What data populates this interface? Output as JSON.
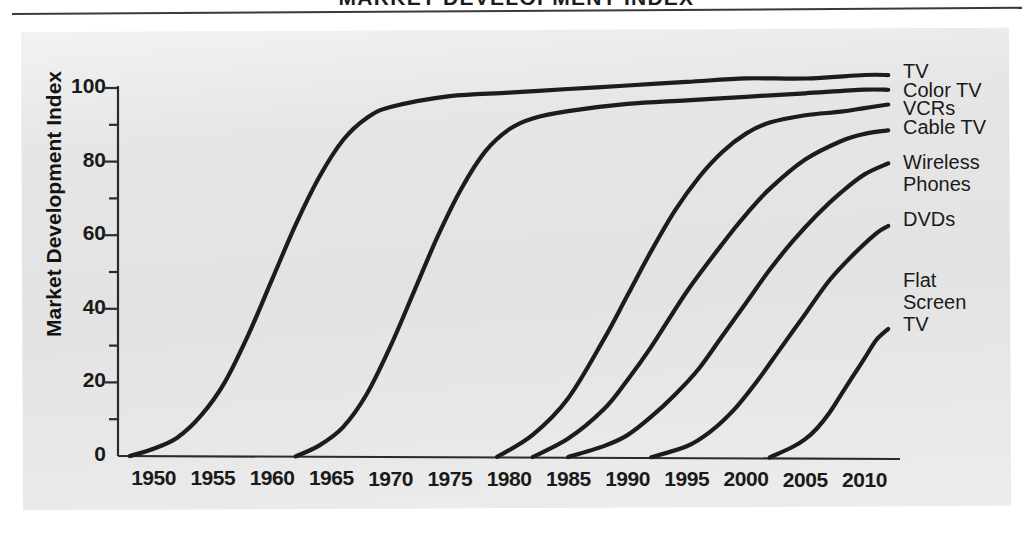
{
  "header": {
    "title": "MARKET DEVELOPMENT INDEX",
    "rule": "horizontal-rule"
  },
  "colors": {
    "panel_background": "#e3e3e3",
    "curve": "#1c1c1c",
    "axis": "#2b2b2b",
    "text": "#1a1a1a"
  },
  "chart_data": {
    "type": "line",
    "title": "MARKET DEVELOPMENT INDEX",
    "xlabel": "",
    "ylabel": "Market Development Index",
    "xlim": [
      1947,
      2013
    ],
    "ylim": [
      0,
      107
    ],
    "grid": false,
    "legend_position": "right-inline-labels",
    "x_ticks": [
      "1950",
      "1955",
      "1960",
      "1965",
      "1970",
      "1975",
      "1980",
      "1985",
      "1990",
      "1995",
      "2000",
      "2005",
      "2010"
    ],
    "x_tick_values": [
      1950,
      1955,
      1960,
      1965,
      1970,
      1975,
      1980,
      1985,
      1990,
      1995,
      2000,
      2005,
      2010
    ],
    "y_ticks": [
      "0",
      "20",
      "40",
      "60",
      "80",
      "100"
    ],
    "y_tick_values": [
      0,
      20,
      40,
      60,
      80,
      100
    ],
    "y_minor_ticks": [
      10,
      30,
      50,
      70,
      90
    ],
    "series": [
      {
        "name": "TV",
        "label": "TV",
        "start_year": 1948,
        "x": [
          1948,
          1950,
          1952,
          1954,
          1956,
          1958,
          1960,
          1962,
          1964,
          1966,
          1968,
          1970,
          1975,
          1980,
          1985,
          1990,
          1995,
          2000,
          2005,
          2010,
          2012
        ],
        "values": [
          0,
          2,
          5,
          11,
          20,
          33,
          48,
          63,
          76,
          86,
          92,
          95,
          98,
          99,
          100,
          101,
          102,
          103,
          103,
          104,
          104
        ]
      },
      {
        "name": "Color TV",
        "label": "Color TV",
        "start_year": 1962,
        "x": [
          1962,
          1964,
          1966,
          1968,
          1970,
          1972,
          1974,
          1976,
          1978,
          1980,
          1982,
          1985,
          1990,
          1995,
          2000,
          2005,
          2010,
          2012
        ],
        "values": [
          0,
          3,
          8,
          17,
          30,
          45,
          60,
          73,
          83,
          89,
          92,
          94,
          96,
          97,
          98,
          99,
          100,
          100
        ]
      },
      {
        "name": "VCRs",
        "label": "VCRs",
        "start_year": 1979,
        "x": [
          1979,
          1982,
          1985,
          1988,
          1990,
          1992,
          1994,
          1996,
          1998,
          2000,
          2002,
          2005,
          2008,
          2010,
          2012
        ],
        "values": [
          0,
          6,
          16,
          32,
          44,
          56,
          67,
          76,
          83,
          88,
          91,
          93,
          94,
          95,
          96
        ]
      },
      {
        "name": "Cable TV",
        "label": "Cable TV",
        "start_year": 1982,
        "x": [
          1982,
          1985,
          1988,
          1990,
          1992,
          1995,
          1998,
          2000,
          2002,
          2005,
          2008,
          2010,
          2012
        ],
        "values": [
          0,
          5,
          13,
          21,
          30,
          45,
          58,
          66,
          73,
          81,
          86,
          88,
          89
        ]
      },
      {
        "name": "Wireless Phones",
        "label": "Wireless\nPhones",
        "start_year": 1985,
        "x": [
          1985,
          1988,
          1990,
          1992,
          1994,
          1996,
          1998,
          2000,
          2002,
          2004,
          2006,
          2008,
          2010,
          2012
        ],
        "values": [
          0,
          3,
          6,
          11,
          17,
          24,
          33,
          42,
          51,
          59,
          66,
          72,
          77,
          80
        ]
      },
      {
        "name": "DVDs",
        "label": "DVDs",
        "start_year": 1992,
        "x": [
          1992,
          1995,
          1997,
          1999,
          2001,
          2003,
          2005,
          2007,
          2009,
          2011,
          2012
        ],
        "values": [
          0,
          3,
          7,
          13,
          21,
          30,
          39,
          48,
          55,
          61,
          63
        ]
      },
      {
        "name": "Flat Screen TV",
        "label": "Flat\nScreen\nTV",
        "start_year": 2002,
        "x": [
          2002,
          2004,
          2005,
          2006,
          2007,
          2008,
          2009,
          2010,
          2011,
          2012
        ],
        "values": [
          0,
          3,
          5,
          8,
          12,
          17,
          22,
          27,
          32,
          35
        ]
      }
    ]
  },
  "series_labels": [
    {
      "text": "TV",
      "top": 61,
      "left": 903
    },
    {
      "text": "Color TV",
      "top": 80,
      "left": 903
    },
    {
      "text": "VCRs",
      "top": 98,
      "left": 903
    },
    {
      "text": "Cable TV",
      "top": 117,
      "left": 903
    },
    {
      "text": "Wireless",
      "top": 152,
      "left": 903
    },
    {
      "text": "Phones",
      "top": 174,
      "left": 903
    },
    {
      "text": "DVDs",
      "top": 209,
      "left": 903
    },
    {
      "text": "Flat",
      "top": 270,
      "left": 903
    },
    {
      "text": "Screen",
      "top": 292,
      "left": 903
    },
    {
      "text": "TV",
      "top": 314,
      "left": 903
    }
  ]
}
